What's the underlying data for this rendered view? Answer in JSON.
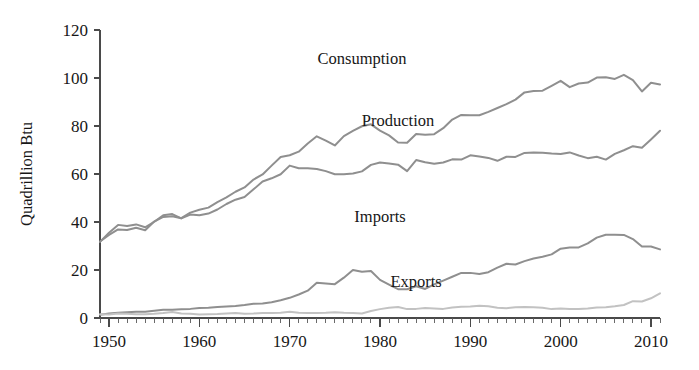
{
  "chart_data": {
    "type": "line",
    "title": "",
    "subtitle": "",
    "xlabel": "",
    "ylabel": "Quadrillion Btu",
    "xlim": [
      1949,
      2011
    ],
    "ylim": [
      0,
      120
    ],
    "grid": false,
    "legend_position": "inline-annotations",
    "x_ticks": [
      1950,
      1960,
      1970,
      1980,
      1990,
      2000,
      2010
    ],
    "x_tick_labels": [
      "1950",
      "1960",
      "1970",
      "1980",
      "1990",
      "2000",
      "2010"
    ],
    "x_minor_tick_interval": 1,
    "y_ticks": [
      0,
      20,
      40,
      60,
      80,
      100,
      120
    ],
    "y_tick_labels": [
      "0",
      "20",
      "40",
      "60",
      "80",
      "100",
      "120"
    ],
    "x": [
      1949,
      1950,
      1951,
      1952,
      1953,
      1954,
      1955,
      1956,
      1957,
      1958,
      1959,
      1960,
      1961,
      1962,
      1963,
      1964,
      1965,
      1966,
      1967,
      1968,
      1969,
      1970,
      1971,
      1972,
      1973,
      1974,
      1975,
      1976,
      1977,
      1978,
      1979,
      1980,
      1981,
      1982,
      1983,
      1984,
      1985,
      1986,
      1987,
      1988,
      1989,
      1990,
      1991,
      1992,
      1993,
      1994,
      1995,
      1996,
      1997,
      1998,
      1999,
      2000,
      2001,
      2002,
      2003,
      2004,
      2005,
      2006,
      2007,
      2008,
      2009,
      2010,
      2011
    ],
    "series": [
      {
        "name": "Consumption",
        "color": "#8f8f8f",
        "label_x": 1978,
        "label_y": 106,
        "values": [
          31.9,
          34.6,
          36.9,
          36.7,
          37.6,
          36.6,
          40.2,
          42.1,
          42.4,
          41.6,
          43.9,
          45.1,
          46.0,
          48.3,
          50.3,
          52.6,
          54.4,
          57.7,
          59.8,
          63.5,
          67.1,
          67.8,
          69.3,
          72.7,
          75.7,
          73.9,
          71.9,
          75.8,
          78.0,
          79.9,
          80.7,
          78.1,
          76.1,
          73.1,
          73.0,
          76.7,
          76.4,
          76.6,
          79.1,
          82.7,
          84.6,
          84.5,
          84.5,
          85.9,
          87.5,
          89.1,
          91.0,
          94.0,
          94.6,
          94.7,
          96.7,
          98.8,
          96.2,
          97.7,
          98.1,
          100.2,
          100.3,
          99.6,
          101.3,
          99.1,
          94.4,
          98.0,
          97.3
        ]
      },
      {
        "name": "Production",
        "color": "#8f8f8f",
        "label_x": 1982,
        "label_y": 80,
        "values": [
          31.7,
          35.5,
          38.8,
          38.3,
          39.0,
          37.8,
          40.1,
          42.8,
          43.3,
          41.5,
          43.1,
          42.8,
          43.5,
          45.2,
          47.5,
          49.3,
          50.4,
          53.6,
          56.9,
          58.2,
          59.9,
          63.5,
          62.4,
          62.4,
          62.1,
          61.2,
          59.9,
          59.9,
          60.2,
          61.1,
          63.8,
          64.8,
          64.4,
          63.9,
          61.2,
          65.8,
          64.9,
          64.3,
          64.8,
          66.1,
          66.0,
          67.8,
          67.3,
          66.7,
          65.5,
          67.2,
          67.1,
          68.8,
          69.0,
          68.9,
          68.5,
          68.3,
          69.0,
          67.7,
          66.6,
          67.2,
          66.0,
          68.4,
          69.9,
          71.6,
          70.9,
          74.4,
          78.0
        ]
      },
      {
        "name": "Imports",
        "color": "#8f8f8f",
        "label_x": 1980,
        "label_y": 40,
        "values": [
          1.4,
          1.9,
          2.2,
          2.4,
          2.6,
          2.6,
          3.0,
          3.4,
          3.4,
          3.6,
          3.8,
          4.2,
          4.3,
          4.6,
          4.8,
          5.0,
          5.4,
          5.9,
          6.0,
          6.6,
          7.4,
          8.4,
          9.8,
          11.4,
          14.7,
          14.4,
          14.1,
          16.8,
          20.0,
          19.3,
          19.6,
          15.9,
          13.9,
          12.0,
          12.0,
          13.2,
          12.1,
          14.0,
          15.6,
          17.2,
          18.8,
          18.8,
          18.3,
          19.1,
          21.0,
          22.6,
          22.3,
          23.7,
          24.8,
          25.5,
          26.5,
          28.9,
          29.4,
          29.4,
          31.1,
          33.5,
          34.7,
          34.7,
          34.6,
          32.9,
          29.8,
          29.8,
          28.6
        ]
      },
      {
        "name": "Exports",
        "color": "#c2c2c2",
        "label_x": 1984,
        "label_y": 13,
        "values": [
          1.6,
          1.5,
          1.9,
          1.8,
          1.6,
          1.6,
          1.8,
          2.1,
          2.5,
          1.9,
          1.8,
          1.5,
          1.6,
          1.7,
          1.9,
          2.1,
          1.8,
          1.9,
          2.1,
          2.1,
          2.2,
          2.6,
          2.2,
          2.1,
          2.1,
          2.2,
          2.4,
          2.2,
          2.1,
          1.9,
          2.9,
          3.7,
          4.3,
          4.6,
          3.7,
          3.8,
          4.2,
          4.0,
          3.8,
          4.4,
          4.7,
          4.8,
          5.1,
          4.9,
          4.3,
          4.1,
          4.5,
          4.6,
          4.5,
          4.3,
          3.7,
          4.0,
          3.8,
          3.7,
          4.0,
          4.4,
          4.5,
          4.9,
          5.4,
          7.0,
          6.9,
          8.2,
          10.3
        ]
      }
    ]
  },
  "axis": {
    "y_title": "Quadrillion Btu"
  }
}
